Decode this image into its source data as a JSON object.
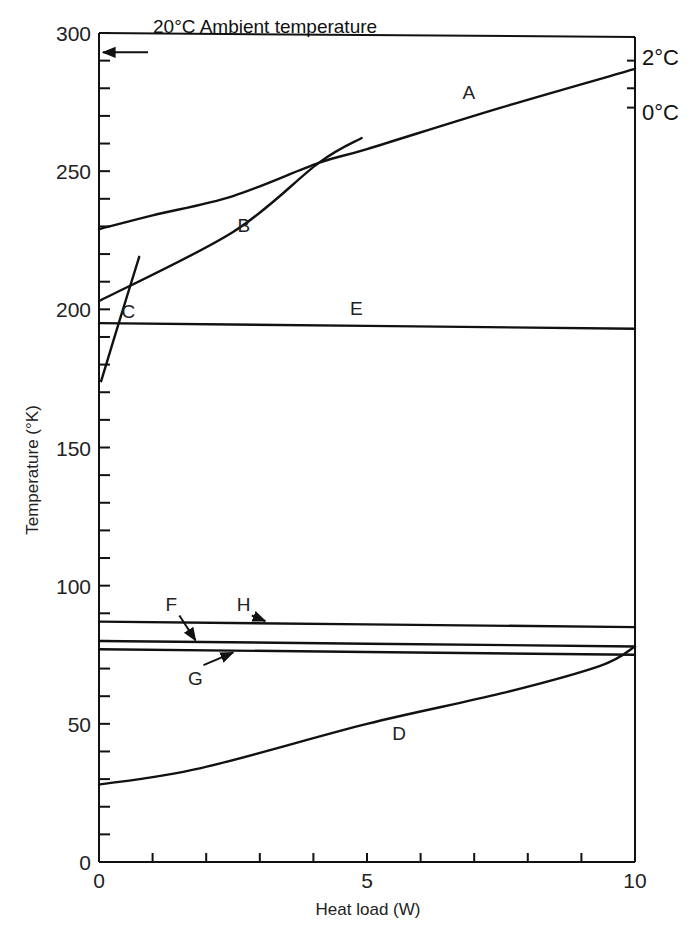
{
  "chart_data": {
    "type": "line",
    "title": "",
    "xlabel": "Heat load (W)",
    "ylabel": "Temperature (°K)",
    "xlim": [
      0,
      10
    ],
    "ylim": [
      0,
      300
    ],
    "x_ticks_major": [
      0,
      5,
      10
    ],
    "x_tick_labels": [
      "0",
      "5",
      "10"
    ],
    "x_minor_step": 1,
    "y_ticks_major": [
      0,
      50,
      100,
      150,
      200,
      250,
      300
    ],
    "y_tick_labels": [
      "0",
      "50",
      "100",
      "150",
      "200",
      "250",
      "300"
    ],
    "y_minor_step": 10,
    "grid": false,
    "legend": "none (curves labelled inline A–H)",
    "right_axis_labels": [
      {
        "label": "2°C",
        "y": 290
      },
      {
        "label": "0°C",
        "y": 273
      }
    ],
    "right_axis_ticks": [
      290,
      280,
      273
    ],
    "annotations": [
      {
        "text": "20°C  Ambient temperature",
        "arrow_to": {
          "x": 0,
          "y": 293
        }
      }
    ],
    "series": [
      {
        "name": "A",
        "x": [
          0,
          1,
          2.5,
          4.1,
          5,
          7.5,
          10
        ],
        "values": [
          229,
          234,
          241,
          253,
          258,
          273,
          287
        ],
        "label_at": {
          "x": 6.9,
          "y": 276
        }
      },
      {
        "name": "B",
        "x": [
          0,
          2.5,
          4.1,
          4.9
        ],
        "values": [
          203,
          228,
          253,
          262
        ],
        "label_at": {
          "x": 2.7,
          "y": 228
        }
      },
      {
        "name": "C",
        "x": [
          0.04,
          0.4,
          0.75
        ],
        "values": [
          174,
          197,
          219
        ],
        "label_at": {
          "x": 0.55,
          "y": 197
        }
      },
      {
        "name": "D",
        "x": [
          0,
          1.9,
          5,
          7.5,
          9.35,
          10
        ],
        "values": [
          28,
          34,
          50,
          61,
          71,
          78
        ],
        "label_at": {
          "x": 5.6,
          "y": 44
        }
      },
      {
        "name": "E",
        "x": [
          0,
          10
        ],
        "values": [
          195,
          193
        ],
        "label_at": {
          "x": 4.8,
          "y": 198
        }
      },
      {
        "name": "F",
        "x": [
          0,
          10
        ],
        "values": [
          80,
          78
        ],
        "label_at": {
          "x": 1.35,
          "y": 91
        },
        "arrow_to": {
          "x": 1.8,
          "y": 79.5
        }
      },
      {
        "name": "G",
        "x": [
          0,
          10
        ],
        "values": [
          77,
          75
        ],
        "label_at": {
          "x": 1.8,
          "y": 64
        },
        "arrow_to": {
          "x": 2.5,
          "y": 76.5
        }
      },
      {
        "name": "H",
        "x": [
          0,
          10
        ],
        "values": [
          87,
          85
        ],
        "label_at": {
          "x": 2.7,
          "y": 91
        },
        "arrow_to": {
          "x": 3.1,
          "y": 86.5
        }
      }
    ]
  },
  "labels": {
    "xlabel": "Heat load (W)",
    "ylabel": "Temperature (°K)",
    "annotation": "20°C  Ambient temperature",
    "right_top": "2°C",
    "right_bottom": "0°C"
  }
}
